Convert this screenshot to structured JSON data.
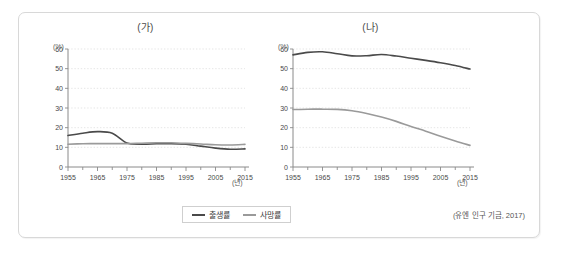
{
  "figure": {
    "source_note": "(유엔 인구 기금, 2017)",
    "legend": {
      "entries": [
        {
          "label": "출생률",
          "color": "#4a4a4a"
        },
        {
          "label": "사망률",
          "color": "#9a9a9a"
        }
      ]
    }
  },
  "panels": [
    {
      "key": "a",
      "title": "(가)",
      "y_unit": "(%)",
      "x_unit": "(년)"
    },
    {
      "key": "b",
      "title": "(나)",
      "y_unit": "(%)",
      "x_unit": "(년)"
    }
  ],
  "chart_data": [
    {
      "id": "panel-a",
      "type": "line",
      "title": "(가)",
      "xlabel": "(년)",
      "ylabel": "(%)",
      "xlim": [
        1955,
        2015
      ],
      "ylim": [
        0,
        60
      ],
      "yticks": [
        0,
        10,
        20,
        30,
        40,
        50,
        60
      ],
      "xticks": [
        1955,
        1965,
        1975,
        1985,
        1995,
        2005,
        2015
      ],
      "xtick_labels": [
        "1955",
        "1965",
        "1975",
        "1985",
        "1995",
        "2005",
        "2015"
      ],
      "ytick_labels": [
        "0",
        "10",
        "20",
        "30",
        "40",
        "50",
        "60"
      ],
      "grid": true,
      "legend_position": "bottom-center",
      "x": [
        1955,
        1960,
        1965,
        1970,
        1975,
        1980,
        1985,
        1990,
        1995,
        2000,
        2005,
        2010,
        2015
      ],
      "series": [
        {
          "name": "출생률",
          "color": "#4a4a4a",
          "values": [
            16.0,
            17.2,
            18.0,
            17.2,
            12.2,
            11.6,
            11.8,
            11.9,
            11.6,
            10.6,
            9.6,
            9.0,
            9.2
          ]
        },
        {
          "name": "사망률",
          "color": "#9a9a9a",
          "values": [
            11.6,
            11.8,
            11.9,
            11.9,
            11.9,
            12.1,
            12.3,
            12.3,
            12.0,
            11.7,
            11.3,
            11.2,
            11.5
          ]
        }
      ]
    },
    {
      "id": "panel-b",
      "type": "line",
      "title": "(나)",
      "xlabel": "(년)",
      "ylabel": "(%)",
      "xlim": [
        1955,
        2015
      ],
      "ylim": [
        0,
        60
      ],
      "yticks": [
        0,
        10,
        20,
        30,
        40,
        50,
        60
      ],
      "xticks": [
        1955,
        1965,
        1975,
        1985,
        1995,
        2005,
        2015
      ],
      "xtick_labels": [
        "1955",
        "1965",
        "1975",
        "1985",
        "1995",
        "2005",
        "2015"
      ],
      "ytick_labels": [
        "0",
        "10",
        "20",
        "30",
        "40",
        "50",
        "60"
      ],
      "grid": true,
      "legend_position": "bottom-center",
      "x": [
        1955,
        1960,
        1965,
        1970,
        1975,
        1980,
        1985,
        1990,
        1995,
        2000,
        2005,
        2010,
        2015
      ],
      "series": [
        {
          "name": "출생률",
          "color": "#4a4a4a",
          "values": [
            57.0,
            58.3,
            58.6,
            57.6,
            56.5,
            56.6,
            57.2,
            56.4,
            55.3,
            54.2,
            53.0,
            51.6,
            49.8
          ]
        },
        {
          "name": "사망률",
          "color": "#9a9a9a",
          "values": [
            29.2,
            29.4,
            29.4,
            29.3,
            28.6,
            27.2,
            25.4,
            23.2,
            20.6,
            18.2,
            15.6,
            13.2,
            11.0
          ]
        }
      ]
    }
  ]
}
